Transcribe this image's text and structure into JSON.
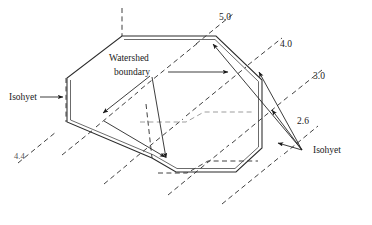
{
  "figure": {
    "background_color": "#ffffff",
    "line_color": "#2b2b2b",
    "width": 372,
    "height": 225,
    "labels": {
      "watershed_line1": "Watershed",
      "watershed_line2": "boundary",
      "isohyet_left": "Isohyet",
      "isohyet_right": "Isohyet",
      "value_5_0": "5.0",
      "value_4_0": "4.0",
      "value_3_0": "3.0",
      "value_2_6": "2.6",
      "value_4_4": "4.4"
    },
    "isohyet_values": [
      "5.0",
      "4.0",
      "3.0",
      "2.6",
      "4.4"
    ],
    "annotations": [
      {
        "name": "isohyet-left-callout",
        "text": "Isohyet",
        "points_to": "left-boundary-isohyet"
      },
      {
        "name": "isohyet-right-callout",
        "text": "Isohyet",
        "points_to": "right-isohyet-group"
      },
      {
        "name": "watershed-boundary-callout",
        "text": "Watershed boundary",
        "points_to": "watershed-polygon"
      }
    ]
  }
}
